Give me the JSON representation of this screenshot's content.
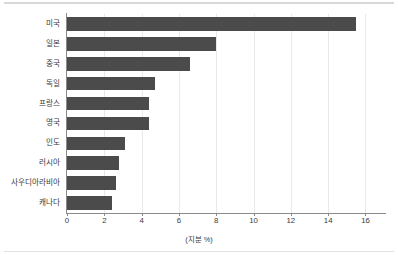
{
  "chart_data": {
    "type": "bar",
    "orientation": "horizontal",
    "title": "",
    "subtitle": "",
    "xlabel": "(지분 %)",
    "ylabel": "",
    "xlim": [
      0,
      17.1
    ],
    "ylim": null,
    "grid": true,
    "grid_axis": "x",
    "legend": null,
    "bar_color": "#4b4b4b",
    "categories": [
      "미국",
      "일본",
      "중국",
      "독일",
      "프랑스",
      "영국",
      "인도",
      "러시아",
      "사우디아라비아",
      "캐나다"
    ],
    "values": [
      15.5,
      8.0,
      6.6,
      4.7,
      4.4,
      4.4,
      3.1,
      2.8,
      2.6,
      2.4
    ],
    "xticks": [
      0,
      2,
      4,
      6,
      8,
      10,
      12,
      14,
      16
    ],
    "xtick_labels": [
      "0",
      "2",
      "4",
      "6",
      "8",
      "10",
      "12",
      "14",
      "16"
    ]
  },
  "figure": {
    "background": "#ffffff",
    "axis_color": "#8a8a8a",
    "grid_color": "#e9e9e9",
    "text_color": "#3a3a3a"
  }
}
